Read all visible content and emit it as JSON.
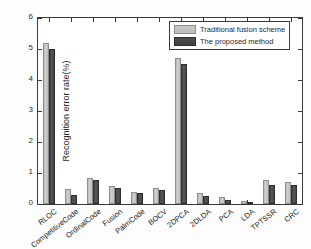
{
  "chart_data": {
    "type": "bar",
    "title": "",
    "xlabel": "",
    "ylabel": "Recognition error rate(%)",
    "ylim": [
      0,
      6
    ],
    "yticks": [
      0,
      1,
      2,
      3,
      4,
      5,
      6
    ],
    "ytick_labels": [
      "0",
      "1",
      "2",
      "3",
      "4",
      "5",
      "6"
    ],
    "grid": false,
    "legend_position": "upper right",
    "categories": [
      "RLOC",
      "CompetitiveCode",
      "OrdinalCode",
      "Fusion",
      "PalmCode",
      "BOCV",
      "2DPCA",
      "2DLDA",
      "PCA",
      "LDA",
      "TPTSSR",
      "CRC"
    ],
    "series": [
      {
        "name": "Traditional fusion scheme",
        "color": "#bdbdbd",
        "values": [
          5.2,
          0.48,
          0.83,
          0.58,
          0.39,
          0.51,
          4.72,
          0.34,
          0.22,
          0.09,
          0.79,
          0.71
        ]
      },
      {
        "name": "The proposed method",
        "color": "#454545",
        "values": [
          5.01,
          0.3,
          0.77,
          0.52,
          0.35,
          0.46,
          4.53,
          0.26,
          0.14,
          0.03,
          0.61,
          0.6
        ]
      }
    ]
  },
  "legend": {
    "items": [
      {
        "label": "Traditional fusion scheme"
      },
      {
        "label": "The proposed method"
      }
    ]
  }
}
